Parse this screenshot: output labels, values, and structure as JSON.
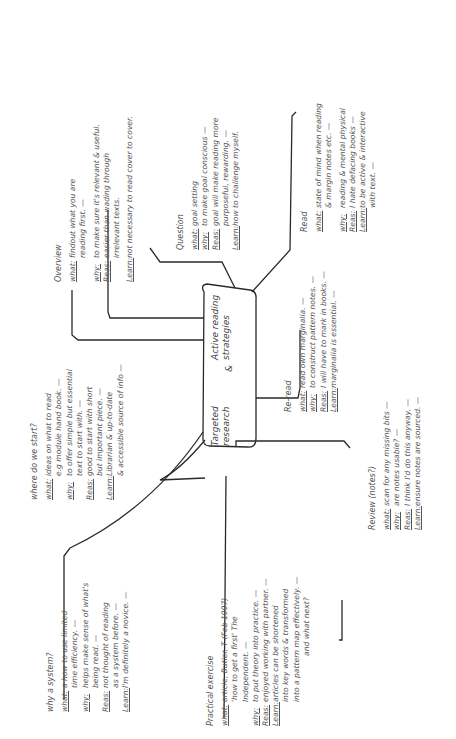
{
  "center": {
    "line1a": "Targeted",
    "line1b": "research",
    "amp": "&",
    "line2a": "Active reading",
    "line2b": "strategies"
  },
  "branches": {
    "read": {
      "title": "Read",
      "rows": [
        {
          "key": "what:",
          "lines": [
            "state of mind when reading",
            "& margin notes etc. —"
          ]
        },
        {
          "key": "why:",
          "lines": [
            "reading & mental physical"
          ]
        },
        {
          "key": "Reas:",
          "lines": [
            "I hate defacing books —"
          ]
        },
        {
          "key": "Learn:",
          "lines": [
            "to be active & interactive",
            "with text. —"
          ]
        }
      ]
    },
    "question": {
      "title": "Question",
      "rows": [
        {
          "key": "what:",
          "lines": [
            "goal setting"
          ]
        },
        {
          "key": "why:",
          "lines": [
            "to make goal conscious —"
          ]
        },
        {
          "key": "Reas:",
          "lines": [
            "goal will make reading more",
            "purposeful, rewarding. —"
          ]
        },
        {
          "key": "Learn:",
          "lines": [
            "how to challenge myself."
          ]
        }
      ]
    },
    "overview": {
      "title": "Overview",
      "rows": [
        {
          "key": "what:",
          "lines": [
            "findout what you are",
            "reading first. —"
          ]
        },
        {
          "key": "why:",
          "lines": [
            "to make sure it's relevant & useful."
          ]
        },
        {
          "key": "Reas:",
          "lines": [
            "easier than wading through",
            "irrelevant texts."
          ]
        },
        {
          "key": "Learn:",
          "lines": [
            "not necessary to read cover to cover."
          ]
        }
      ]
    },
    "where_start": {
      "title": "where do we start?",
      "rows": [
        {
          "key": "what:",
          "lines": [
            "ideas on what to read",
            "e.g module hand book. —"
          ]
        },
        {
          "key": "why:",
          "lines": [
            "to offer simple but essential",
            "text to start with. —"
          ]
        },
        {
          "key": "Reas:",
          "lines": [
            "good to start with short",
            "but important piece. —"
          ]
        },
        {
          "key": "Learn:",
          "lines": [
            "Librarian & up-to-date",
            "& accessible source of info —"
          ]
        }
      ]
    },
    "why_system": {
      "title": "why a system?",
      "rows": [
        {
          "key": "what:",
          "lines": [
            "a how to use limited",
            "time efficiency. —"
          ]
        },
        {
          "key": "why:",
          "lines": [
            "helps make sense of what's",
            "being read. —"
          ]
        },
        {
          "key": "Reas:",
          "lines": [
            "not thought of reading",
            "as a system before. —"
          ]
        },
        {
          "key": "Learn:",
          "lines": [
            "I'm definitely a novice. —"
          ]
        }
      ]
    },
    "practical": {
      "title": "Practical exercise",
      "rows": [
        {
          "key": "what:",
          "lines": [
            "article, Butler, T (Feb 1997)",
            "'how to get a first' The",
            "Independent. —"
          ]
        },
        {
          "key": "why:",
          "lines": [
            "to put theory into practice. —"
          ]
        },
        {
          "key": "Reas:",
          "lines": [
            "enjoyed working with partner. —"
          ]
        },
        {
          "key": "Learn:",
          "lines": [
            "articles can be shortened",
            "into key words & transformed",
            "into a pattern map effectively. —"
          ]
        }
      ],
      "followup": "and what next?"
    },
    "reread": {
      "title": "Re-read",
      "rows": [
        {
          "key": "what:",
          "lines": [
            "read own marginalia. —"
          ]
        },
        {
          "key": "why:",
          "lines": [
            "to construct pattern notes. —"
          ]
        },
        {
          "key": "Reas:",
          "lines": [
            "I will have to mark in books. —"
          ]
        },
        {
          "key": "Learn:",
          "lines": [
            "marginalia is essential. —"
          ]
        }
      ]
    },
    "review": {
      "title": "Review (notes?)",
      "rows": [
        {
          "key": "what:",
          "lines": [
            "scan for any missing bits —"
          ]
        },
        {
          "key": "why:",
          "lines": [
            "are notes usable? —"
          ]
        },
        {
          "key": "Reas:",
          "lines": [
            "I think I'd do this anyway. —"
          ]
        },
        {
          "key": "Learn:",
          "lines": [
            "ensure notes are sourced. —"
          ]
        }
      ]
    }
  },
  "colors": {
    "ink": "#2a2a2a",
    "text": "#555555",
    "background": "#ffffff"
  }
}
